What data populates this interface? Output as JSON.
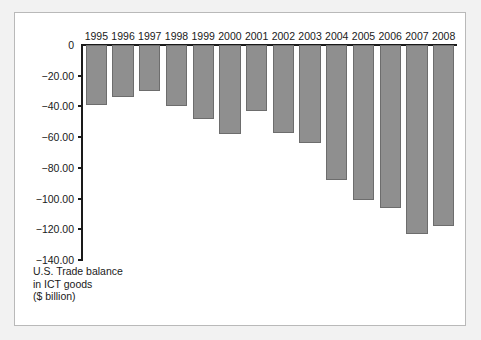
{
  "chart_data": {
    "type": "bar",
    "title": "",
    "subtitle": "",
    "caption": "U.S. Trade balance\nin ICT goods\n($ billion)",
    "xlabel": "",
    "ylabel": "",
    "categories": [
      "1995",
      "1996",
      "1997",
      "1998",
      "1999",
      "2000",
      "2001",
      "2002",
      "2003",
      "2004",
      "2005",
      "2006",
      "2007",
      "2008"
    ],
    "values": [
      -39.0,
      -34.0,
      -30.0,
      -39.5,
      -48.0,
      -58.0,
      -43.0,
      -57.0,
      -64.0,
      -88.0,
      -101.0,
      -106.0,
      -123.0,
      -118.0
    ],
    "ylim": [
      -140,
      0
    ],
    "yticks": [
      0,
      -20,
      -40,
      -60,
      -80,
      -100,
      -120,
      -140
    ],
    "ytick_labels": [
      "0",
      "−20.00",
      "−40.00",
      "−60.00",
      "−80.00",
      "−100.00",
      "−120.00",
      "−140.00"
    ],
    "grid": false,
    "legend": null,
    "bar_color": "#8f8f8f",
    "bar_edge_color": "#6d6d6d",
    "axis_color": "#1a1a1a",
    "plot_background": "#ffffff",
    "figure_background": "#f2f2f2"
  }
}
